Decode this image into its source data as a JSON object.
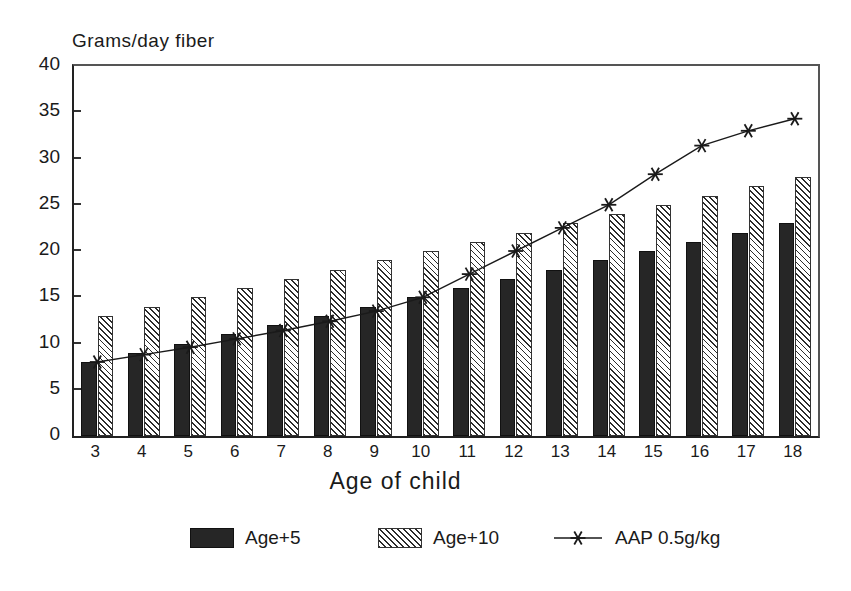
{
  "chart_data": {
    "type": "bar",
    "title": "",
    "ylabel": "Grams/day fiber",
    "xlabel": "Age of child",
    "categories": [
      "3",
      "4",
      "5",
      "6",
      "7",
      "8",
      "9",
      "10",
      "11",
      "12",
      "13",
      "14",
      "15",
      "16",
      "17",
      "18"
    ],
    "ylim": [
      0,
      40
    ],
    "yticks": [
      0,
      5,
      10,
      15,
      20,
      25,
      30,
      35,
      40
    ],
    "grid": false,
    "legend_position": "bottom",
    "series": [
      {
        "name": "Age+5",
        "type": "bar",
        "values": [
          8,
          9,
          10,
          11,
          12,
          13,
          14,
          15,
          16,
          17,
          18,
          19,
          20,
          21,
          22,
          23
        ]
      },
      {
        "name": "Age+10",
        "type": "bar",
        "values": [
          13,
          14,
          15,
          16,
          17,
          18,
          19,
          20,
          21,
          22,
          23,
          24,
          25,
          26,
          27,
          28
        ]
      },
      {
        "name": "AAP 0.5g/kg",
        "type": "line",
        "marker": "asterisk",
        "values": [
          8.0,
          8.8,
          9.6,
          10.5,
          11.4,
          12.4,
          13.5,
          15.0,
          17.5,
          20.0,
          22.5,
          25.0,
          28.3,
          31.4,
          33.0,
          34.3
        ]
      }
    ]
  },
  "legend": {
    "items": [
      {
        "label": "Age+5",
        "marker": "solid-swatch"
      },
      {
        "label": "Age+10",
        "marker": "hatched-swatch"
      },
      {
        "label": "AAP 0.5g/kg",
        "marker": "line-asterisk"
      }
    ]
  },
  "colors": {
    "series_age5": "#262626",
    "series_age10": "#2b2b2b",
    "line": "#1a1a1a",
    "axis": "#222222",
    "background": "#ffffff"
  }
}
